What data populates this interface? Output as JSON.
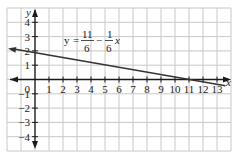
{
  "chart_data": {
    "type": "line",
    "title": "",
    "xlabel": "x",
    "ylabel": "y",
    "xlim": [
      -2,
      14
    ],
    "ylim": [
      -5,
      5
    ],
    "grid": true,
    "x_ticks": [
      1,
      2,
      3,
      4,
      5,
      6,
      7,
      8,
      9,
      10,
      11,
      12,
      13
    ],
    "y_ticks": [
      4,
      3,
      2,
      1,
      -1,
      -2,
      -3,
      -4
    ],
    "origin_label": "0",
    "series": [
      {
        "name": "y = 11/6 - (1/6)x",
        "equation": {
          "lhs": "y",
          "num1": "11",
          "den1": "6",
          "op": "−",
          "num2": "1",
          "den2": "6",
          "var": "x"
        },
        "x": [
          -2,
          0,
          5,
          11,
          13.5
        ],
        "y": [
          2.167,
          1.833,
          1.0,
          0.0,
          -0.417
        ],
        "color": "#333333"
      }
    ],
    "annotations": [
      "y = 11/6 − 1/6 x"
    ]
  }
}
